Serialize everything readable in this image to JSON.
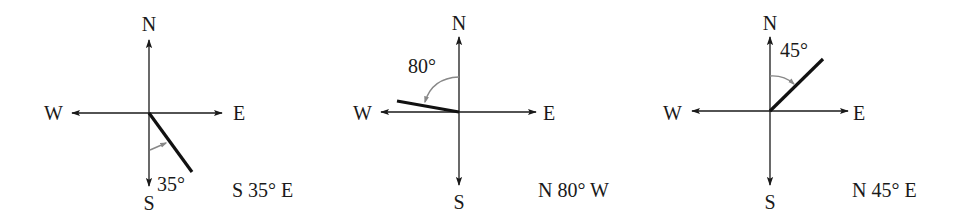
{
  "colors": {
    "axis": "#1a1a1a",
    "bearing_line": "#111111",
    "angle_arc": "#888888",
    "background": "#ffffff"
  },
  "diagrams": [
    {
      "cardinals": {
        "n": "N",
        "s": "S",
        "e": "E",
        "w": "W"
      },
      "angle_label": "35°",
      "bearing_label": "S 35° E",
      "reference": "S",
      "angle_deg": 35,
      "toward": "E"
    },
    {
      "cardinals": {
        "n": "N",
        "s": "S",
        "e": "E",
        "w": "W"
      },
      "angle_label": "80°",
      "bearing_label": "N 80° W",
      "reference": "N",
      "angle_deg": 80,
      "toward": "W"
    },
    {
      "cardinals": {
        "n": "N",
        "s": "S",
        "e": "E",
        "w": "W"
      },
      "angle_label": "45°",
      "bearing_label": "N 45° E",
      "reference": "N",
      "angle_deg": 45,
      "toward": "E"
    }
  ]
}
